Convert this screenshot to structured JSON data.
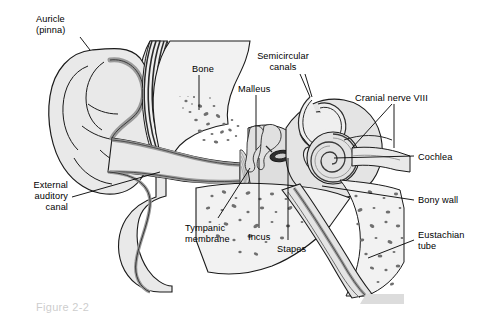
{
  "figure": {
    "caption": "Figure 2-2",
    "background_color": "#ffffff",
    "text_color": "#000000",
    "leader_color": "#000000"
  },
  "palette": {
    "tissue_fill": "#e9e9e9",
    "tissue_fill_light": "#f2f2f2",
    "bone_fill": "#efefef",
    "lining_gray": "#9a9a9a",
    "lining_dark": "#6e6e6e",
    "speckle": "#6f6f6f",
    "outline": "#1a1a1a",
    "dark_band": "#2b2b2b"
  },
  "labels": [
    {
      "id": "auricle",
      "text": "Auricle\n(pinna)",
      "x": 36,
      "y": 14,
      "align": "left"
    },
    {
      "id": "bone",
      "text": "Bone",
      "x": 192,
      "y": 64,
      "align": "left"
    },
    {
      "id": "semicircular",
      "text": "Semicircular\ncanals",
      "x": 283,
      "y": 51,
      "align": "center"
    },
    {
      "id": "malleus",
      "text": "Malleus",
      "x": 238,
      "y": 84,
      "align": "left"
    },
    {
      "id": "cranial-nerve-viii",
      "text": "Cranial nerve VIII",
      "x": 355,
      "y": 93,
      "align": "left"
    },
    {
      "id": "cochlea",
      "text": "Cochlea",
      "x": 418,
      "y": 152,
      "align": "left"
    },
    {
      "id": "external-auditory",
      "text": "External\nauditory\ncanal",
      "x": 12,
      "y": 180,
      "align": "right"
    },
    {
      "id": "bony-wall",
      "text": "Bony wall",
      "x": 418,
      "y": 195,
      "align": "left"
    },
    {
      "id": "tympanic",
      "text": "Tympanic\nmembrane",
      "x": 185,
      "y": 223,
      "align": "left"
    },
    {
      "id": "incus",
      "text": "Incus",
      "x": 248,
      "y": 232,
      "align": "left"
    },
    {
      "id": "stapes",
      "text": "Stapes",
      "x": 277,
      "y": 244,
      "align": "left"
    },
    {
      "id": "eustachian",
      "text": "Eustachian\ntube",
      "x": 418,
      "y": 230,
      "align": "left"
    }
  ],
  "leaders": [
    {
      "id": "leader-auricle",
      "from": "auricle",
      "points": "80,37 90,50"
    },
    {
      "id": "leader-bone",
      "from": "bone",
      "points": "199,75 199,110"
    },
    {
      "id": "leader-semicircular-a",
      "from": "semicircular",
      "points": "300,74 310,97"
    },
    {
      "id": "leader-semicircular-b",
      "from": "semicircular",
      "points": "305,74 312,97"
    },
    {
      "id": "leader-malleus",
      "from": "malleus",
      "points": "256,95 256,150"
    },
    {
      "id": "leader-nerve-a",
      "from": "cranial-nerve-viii",
      "points": "392,104 352,148"
    },
    {
      "id": "leader-nerve-b",
      "from": "cranial-nerve-viii",
      "points": "394,104 394,148"
    },
    {
      "id": "leader-cochlea",
      "from": "cochlea",
      "points": "414,156 334,158"
    },
    {
      "id": "leader-external",
      "from": "external-auditory",
      "points": "72,197 160,172"
    },
    {
      "id": "leader-bony-wall",
      "from": "bony-wall",
      "points": "414,200 322,186"
    },
    {
      "id": "leader-tympanic",
      "from": "tympanic",
      "points": "218,218 250,168"
    },
    {
      "id": "leader-incus",
      "from": "incus",
      "points": "259,228 259,158"
    },
    {
      "id": "leader-stapes",
      "from": "stapes",
      "points": "288,240 288,158"
    },
    {
      "id": "leader-eustachian",
      "from": "eustachian",
      "points": "414,240 368,258"
    }
  ],
  "structures": [
    {
      "id": "auricle-pinna",
      "name": "Auricle (pinna)"
    },
    {
      "id": "external-auditory-canal",
      "name": "External auditory canal"
    },
    {
      "id": "tympanic-membrane",
      "name": "Tympanic membrane"
    },
    {
      "id": "malleus-bone",
      "name": "Malleus"
    },
    {
      "id": "incus-bone",
      "name": "Incus"
    },
    {
      "id": "stapes-bone",
      "name": "Stapes"
    },
    {
      "id": "semicircular-canals",
      "name": "Semicircular canals"
    },
    {
      "id": "cochlea-spiral",
      "name": "Cochlea"
    },
    {
      "id": "cranial-nerve",
      "name": "Cranial nerve VIII"
    },
    {
      "id": "eustachian-tube",
      "name": "Eustachian tube"
    },
    {
      "id": "bony-wall-region",
      "name": "Bony wall"
    },
    {
      "id": "mastoid-bone",
      "name": "Bone"
    }
  ]
}
